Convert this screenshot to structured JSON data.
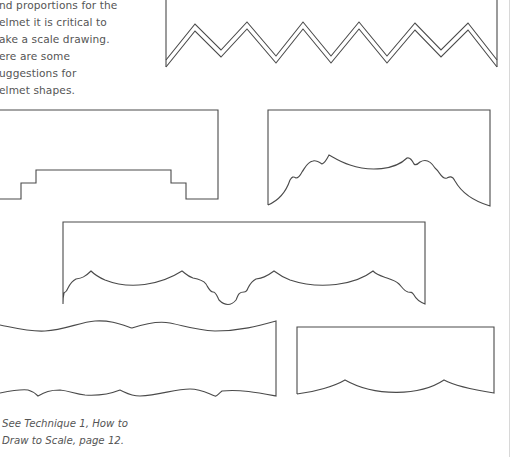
{
  "intro": {
    "lines": [
      "nd proportions for the",
      "elmet it is critical to",
      "ake a scale drawing.",
      "ere are some",
      "uggestions for",
      "elmet shapes."
    ]
  },
  "figures": [
    {
      "name": "zigzag-pelmet",
      "description": "Double-line zigzag bottom edge"
    },
    {
      "name": "stepped-pelmet",
      "description": "Stepped castellated bottom edge"
    },
    {
      "name": "scalloped-arch-pelmet",
      "description": "Central arch with shoulders"
    },
    {
      "name": "long-scalloped-pelmet",
      "description": "Repeated scallops with center drop"
    },
    {
      "name": "wavy-pelmet",
      "description": "Wavy top and bottom edges"
    },
    {
      "name": "triple-scallop-pelmet",
      "description": "Three shallow scallops"
    }
  ],
  "caption": {
    "lines": [
      "See Technique 1, How to",
      "Draw to Scale, page 12."
    ]
  },
  "colors": {
    "text": "#555555",
    "line": "#4a4a4a",
    "background": "#ffffff"
  }
}
